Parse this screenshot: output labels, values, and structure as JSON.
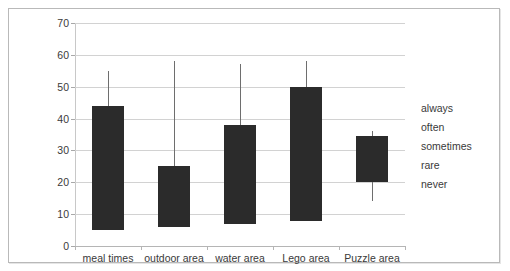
{
  "chart_data": {
    "type": "bar",
    "title": "",
    "subtitle": "",
    "xlabel": "",
    "ylabel": "",
    "categories": [
      "meal times",
      "outdoor area",
      "water area",
      "Lego area",
      "Puzzle area"
    ],
    "values": [
      44,
      25,
      38,
      50,
      34.5
    ],
    "series": [
      {
        "name": "box",
        "values": [
          44,
          25,
          38,
          50,
          34.5
        ]
      }
    ],
    "box_bottoms": [
      5,
      6,
      7,
      8,
      20
    ],
    "box_tops": [
      44,
      25,
      38,
      50,
      34.5
    ],
    "whisker_tops": [
      55,
      58,
      57,
      58,
      36
    ],
    "whisker_bottoms": [
      5,
      6,
      7,
      8,
      14
    ],
    "ylim": [
      0,
      70
    ],
    "yticks": [
      0,
      10,
      20,
      30,
      40,
      50,
      60,
      70
    ],
    "ytick_labels": [
      "0",
      "10",
      "20",
      "30",
      "40",
      "50",
      "60",
      "70"
    ],
    "grid": true,
    "grid_axis": "y",
    "legend_position": "right",
    "legend_entries": [
      "always",
      "often",
      "sometimes",
      "rare",
      "never"
    ],
    "bar_color": "#2b2b2b",
    "whisker_color": "#6e6e6e",
    "grid_color": "#d2d2d2",
    "frame_color": "#b9b9b9",
    "background_color": "#ffffff"
  },
  "legend": {
    "items": [
      {
        "label": "always"
      },
      {
        "label": "often"
      },
      {
        "label": "sometimes"
      },
      {
        "label": "rare"
      },
      {
        "label": "never"
      }
    ]
  }
}
